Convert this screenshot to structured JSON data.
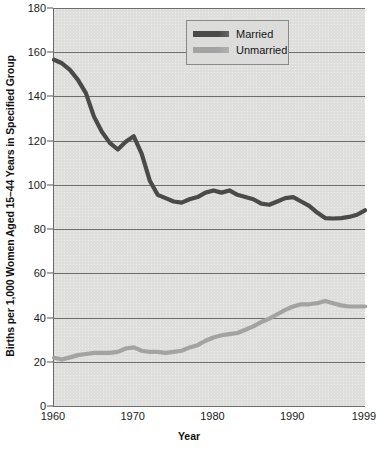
{
  "chart_data": {
    "type": "line",
    "title": "",
    "xlabel": "Year",
    "ylabel": "Births per 1,000 Women Aged 15–44 Years in Specified Group",
    "xlim": [
      1960,
      1999
    ],
    "ylim": [
      0,
      180
    ],
    "grid": true,
    "legend_position": "top-right",
    "y_ticks": [
      0,
      20,
      40,
      60,
      80,
      100,
      120,
      140,
      160,
      180
    ],
    "y_tick_labels": [
      "0",
      "20",
      "40",
      "60",
      "80",
      "100",
      "120",
      "140",
      "160",
      "180"
    ],
    "x_ticks": [
      1960,
      1970,
      1980,
      1990,
      1999
    ],
    "x_tick_labels": [
      "1960",
      "1970",
      "1980",
      "1990",
      "1999"
    ],
    "x": [
      1960,
      1961,
      1962,
      1963,
      1964,
      1965,
      1966,
      1967,
      1968,
      1969,
      1970,
      1971,
      1972,
      1973,
      1974,
      1975,
      1976,
      1977,
      1978,
      1979,
      1980,
      1981,
      1982,
      1983,
      1984,
      1985,
      1986,
      1987,
      1988,
      1989,
      1990,
      1991,
      1992,
      1993,
      1994,
      1995,
      1996,
      1997,
      1998,
      1999
    ],
    "series": [
      {
        "name": "Married",
        "color": "#4a4a4a",
        "values": [
          156.6,
          155.0,
          152.0,
          147.5,
          141.5,
          131.0,
          124.0,
          119.0,
          116.0,
          119.5,
          122.0,
          114.0,
          102.0,
          95.5,
          94.0,
          92.5,
          92.0,
          93.5,
          94.5,
          96.5,
          97.5,
          96.5,
          97.5,
          95.5,
          94.5,
          93.5,
          91.5,
          91.0,
          92.5,
          94.0,
          94.5,
          92.5,
          90.5,
          87.5,
          85.0,
          84.8,
          85.0,
          85.5,
          86.5,
          88.5
        ]
      },
      {
        "name": "Unmarried",
        "color": "#a3a3a3",
        "values": [
          21.8,
          21.0,
          22.0,
          23.0,
          23.5,
          24.0,
          24.0,
          24.0,
          24.5,
          26.0,
          26.5,
          25.0,
          24.5,
          24.5,
          24.0,
          24.5,
          25.0,
          26.5,
          27.5,
          29.5,
          31.0,
          32.0,
          32.5,
          33.0,
          34.5,
          36.0,
          38.0,
          39.5,
          41.5,
          43.5,
          45.0,
          46.0,
          46.0,
          46.5,
          47.5,
          46.5,
          45.5,
          45.0,
          45.0,
          45.0
        ]
      }
    ]
  },
  "legend": {
    "items": [
      {
        "label": "Married",
        "color": "#4a4a4a"
      },
      {
        "label": "Unmarried",
        "color": "#a3a3a3"
      }
    ]
  },
  "axes": {
    "x_title": "Year",
    "y_title": "Births per 1,000 Women Aged 15–44 Years in Specified Group"
  }
}
